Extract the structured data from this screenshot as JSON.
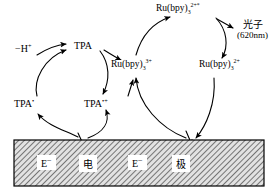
{
  "diagram": {
    "background_color": "#ffffff",
    "line_color": "#000000"
  },
  "labels": {
    "minus_h": "−H",
    "minus_h_sup": "+",
    "tpa": "TPA",
    "tpa_radical": "TPA",
    "tpa_radical_sup": "•",
    "tpa_radical_cation": "TPA",
    "tpa_radical_cation_sup": "•+",
    "ru_base": "Ru(bpy)",
    "ru_sub": "3",
    "ru3_sup": "3+",
    "ru2_excited_sup": "2+*",
    "ru2_sup": "2+",
    "photon": "光子",
    "photon_wavelength": "(620nm)"
  },
  "electrode": {
    "fill_color": "#d9d9d9",
    "border_color": "#000000",
    "hatch_color": "#555555",
    "cells": [
      {
        "name": "electron-left",
        "text": "E",
        "sup": "−"
      },
      {
        "name": "dian-character",
        "text": "电",
        "sup": ""
      },
      {
        "name": "electron-right",
        "text": "E",
        "sup": "−"
      },
      {
        "name": "ji-character",
        "text": "极",
        "sup": ""
      }
    ]
  },
  "cycles": [
    {
      "name": "tpa-cycle",
      "center_x": 72,
      "center_y": 83,
      "radius": 36,
      "nodes": [
        "TPA",
        "TPA•+",
        "TPA•"
      ]
    },
    {
      "name": "ruthenium-cycle",
      "center_x": 183,
      "center_y": 65,
      "radius": 48,
      "nodes": [
        "Ru(bpy)3 2+*",
        "Ru(bpy)3 2+",
        "Ru(bpy)3 3+"
      ]
    }
  ]
}
